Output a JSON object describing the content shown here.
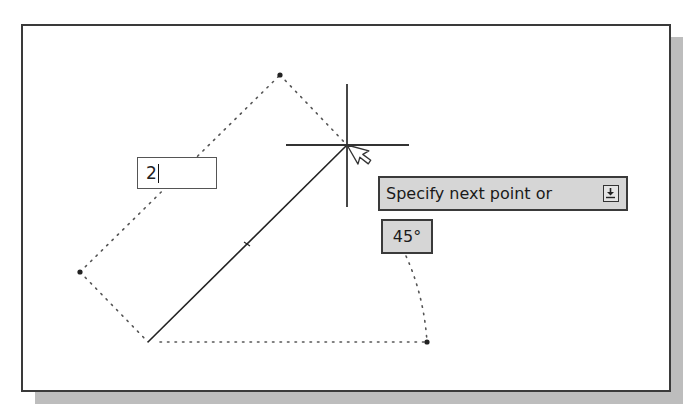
{
  "canvas": {
    "background": "#ffffff",
    "frame_border_color": "#3a3a3a",
    "shadow_color": "#bdbdbd"
  },
  "dynamic_input": {
    "value": "2"
  },
  "tooltip": {
    "prompt": "Specify next point or",
    "options_icon": "down-arrow-options-icon"
  },
  "angle_display": {
    "value": "45°"
  },
  "geometry": {
    "line_start": [
      148,
      342
    ],
    "line_end": [
      347,
      145
    ],
    "crosshair_center": [
      347,
      145
    ],
    "construction_points": [
      [
        280,
        75
      ],
      [
        80,
        272
      ],
      [
        427,
        342
      ]
    ]
  }
}
